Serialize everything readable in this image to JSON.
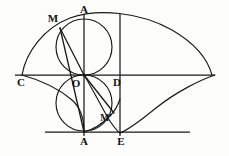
{
  "figure": {
    "background_color": "#fdfdfb",
    "ink_color": "#1a1a1a",
    "width": 229,
    "height": 156
  },
  "labels": {
    "a_top": "A",
    "m_upper": "M",
    "c_left": "C",
    "o_origin": "O",
    "d_right": "D",
    "m_lower": "M'",
    "a_bottom": "A",
    "e_bottom": "E"
  },
  "points": {
    "a_top": {
      "x": 84,
      "y": 18,
      "label_x": 84,
      "label_y": 13
    },
    "m_upper": {
      "x": 62,
      "y": 30,
      "label_x": 53,
      "label_y": 22
    },
    "c_left": {
      "x": 22,
      "y": 75,
      "label_x": 21,
      "label_y": 86
    },
    "o_origin": {
      "x": 84,
      "y": 75,
      "label_x": 76,
      "label_y": 87
    },
    "d_right": {
      "x": 120,
      "y": 75,
      "label_x": 117,
      "label_y": 86
    },
    "m_lower": {
      "x": 112,
      "y": 110,
      "label_x": 106,
      "label_y": 121
    },
    "a_bottom": {
      "x": 84,
      "y": 132,
      "label_x": 84,
      "label_y": 145
    },
    "e_bottom": {
      "x": 120,
      "y": 132,
      "label_x": 121,
      "label_y": 145
    }
  },
  "geometry": {
    "baseline_cd": {
      "x1": 15,
      "y1": 75,
      "x2": 215,
      "y2": 75
    },
    "baseline_lower": {
      "x1": 45,
      "y1": 132,
      "x2": 190,
      "y2": 132
    },
    "axis_vertical_a": {
      "x1": 84,
      "y1": 14,
      "x2": 84,
      "y2": 136
    },
    "axis_vertical_e": {
      "x1": 120,
      "y1": 14,
      "x2": 120,
      "y2": 136
    },
    "circle_upper": {
      "cx": 84,
      "cy": 47,
      "r": 28
    },
    "circle_lower": {
      "cx": 84,
      "cy": 103,
      "r": 28
    },
    "chord_om_upper": {
      "x1": 84,
      "y1": 75,
      "x2": 60,
      "y2": 28
    },
    "chord_om_lower": {
      "x1": 84,
      "y1": 75,
      "x2": 114,
      "y2": 113
    },
    "chord_m_to_abottom": {
      "x1": 60,
      "y1": 28,
      "x2": 84,
      "y2": 132
    },
    "cycloid_upper_arch": "M 22 75 C 26 52 44 28 70 18 C 98 8 140 12 172 30 C 196 44 208 60 212 75",
    "cycloid_lower_right": "M 215 75 C 200 80 176 92 156 108 C 140 121 128 130 120 133",
    "cycloid_lower_inner": "M 84 75 C 92 88 100 104 108 118 C 113 126 117 131 120 133",
    "cycloid_lower_inner2": "M 84 132 C 92 130 102 124 110 116 C 115 111 118 105 120 99",
    "cycloid_left_tail": "M 22 75 C 40 80 58 88 72 100 C 80 107 84 116 84 132"
  },
  "curve_names": {
    "cycloid_upper_arch": "upper-cycloid-arch",
    "cycloid_lower_right": "lower-cycloid-right-branch",
    "cycloid_lower_inner": "lower-cycloid-inner-branch",
    "cycloid_lower_inner2": "lower-cycloid-return-branch",
    "cycloid_left_tail": "left-descending-arc"
  }
}
